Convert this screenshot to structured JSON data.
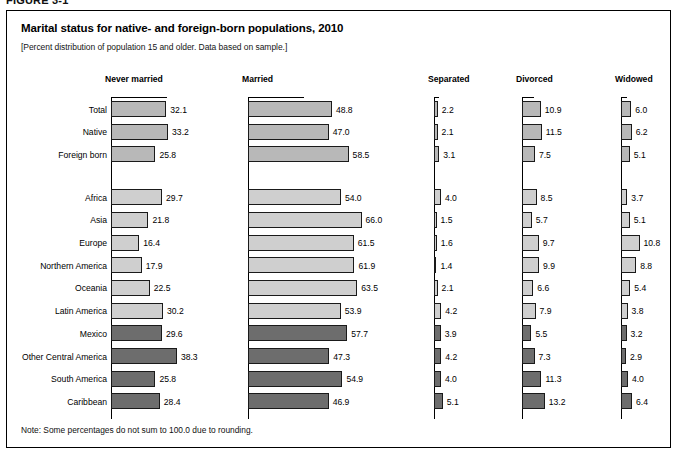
{
  "figure": {
    "label": "FIGURE 3-1",
    "title": "Marital status for native- and foreign-born populations, 2010",
    "subtitle": "[Percent distribution of population 15 and older. Data based on sample.]",
    "note": "Note: Some percentages do not sum to 100.0 due to rounding."
  },
  "colors": {
    "group_total": "#b8b8b8",
    "group_region": "#cfcfcf",
    "group_latin": "#6d6d6d",
    "bar_outline": "#1a1a1a",
    "text": "#000000",
    "border": "#000000"
  },
  "chart_data": {
    "type": "bar",
    "title": "Marital status for native- and foreign-born populations, 2010",
    "subtitle": "[Percent distribution of population 15 and older. Data based on sample.]",
    "xlabel": "",
    "ylabel": "",
    "grid": false,
    "legend_position": "none",
    "orientation": "horizontal",
    "panels": [
      "Never married",
      "Married",
      "Separated",
      "Divorced",
      "Widowed"
    ],
    "categories": [
      "Total",
      "Native",
      "Foreign born",
      "Africa",
      "Asia",
      "Europe",
      "Northern America",
      "Oceania",
      "Latin America",
      "Mexico",
      "Other Central America",
      "South America",
      "Caribbean"
    ],
    "category_groups": [
      "total",
      "total",
      "total",
      "region",
      "region",
      "region",
      "region",
      "region",
      "region",
      "latin",
      "latin",
      "latin",
      "latin"
    ],
    "series": [
      {
        "name": "Never married",
        "values": [
          32.1,
          33.2,
          25.8,
          29.7,
          21.8,
          16.4,
          17.9,
          22.5,
          30.2,
          29.6,
          38.3,
          25.8,
          28.4
        ]
      },
      {
        "name": "Married",
        "values": [
          48.8,
          47.0,
          58.5,
          54.0,
          66.0,
          61.5,
          61.9,
          63.5,
          53.9,
          57.7,
          47.3,
          54.9,
          46.9
        ]
      },
      {
        "name": "Separated",
        "values": [
          2.2,
          2.1,
          3.1,
          4.0,
          1.5,
          1.6,
          1.4,
          2.1,
          4.2,
          3.9,
          4.2,
          4.0,
          5.1
        ]
      },
      {
        "name": "Divorced",
        "values": [
          10.9,
          11.5,
          7.5,
          8.5,
          5.7,
          9.7,
          9.9,
          6.6,
          7.9,
          5.5,
          7.3,
          11.3,
          13.2
        ]
      },
      {
        "name": "Widowed",
        "values": [
          6.0,
          6.2,
          5.1,
          3.7,
          5.1,
          10.8,
          8.8,
          5.4,
          3.8,
          3.2,
          2.9,
          4.0,
          6.4
        ]
      }
    ],
    "value_format": "one-decimal-percent",
    "note": "Note: Some percentages do not sum to 100.0 due to rounding."
  }
}
